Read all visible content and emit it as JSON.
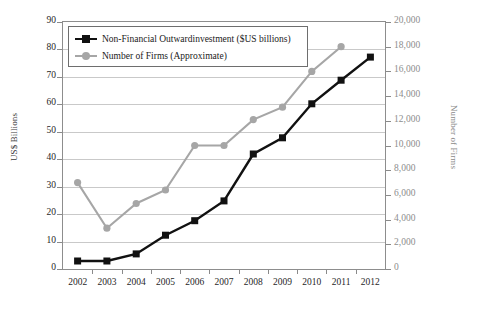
{
  "chart_data": {
    "type": "line",
    "title": "",
    "xlabel": "",
    "ylabel": "US$ Billions",
    "y2label": "Number of Firms",
    "grid": true,
    "legend_position": "top-left",
    "categories": [
      "2002",
      "2003",
      "2004",
      "2005",
      "2006",
      "2007",
      "2008",
      "2009",
      "2010",
      "2011",
      "2012"
    ],
    "x_tick_labels": [
      "2002",
      "2003",
      "2004",
      "2005",
      "2006",
      "2007",
      "2008",
      "2009",
      "2010",
      "2011",
      "2012"
    ],
    "ylim": [
      0,
      90
    ],
    "y_tick_labels": [
      "0",
      "10",
      "20",
      "30",
      "40",
      "50",
      "60",
      "70",
      "80",
      "90"
    ],
    "y_ticks": [
      0,
      10,
      20,
      30,
      40,
      50,
      60,
      70,
      80,
      90
    ],
    "y2lim": [
      0,
      20000
    ],
    "y2_tick_labels": [
      "0",
      "2,000",
      "4,000",
      "6,000",
      "8,000",
      "10,000",
      "12,000",
      "14,000",
      "16,000",
      "18,000",
      "20,000"
    ],
    "y2_ticks": [
      0,
      2000,
      4000,
      6000,
      8000,
      10000,
      12000,
      14000,
      16000,
      18000,
      20000
    ],
    "series": [
      {
        "name": "Non-Financial Outwardinvestment ($US billions)",
        "axis": "left",
        "color": "#111111",
        "marker": "square",
        "values": [
          2.9,
          2.9,
          5.5,
          12.3,
          17.6,
          24.8,
          41.9,
          47.8,
          60.2,
          68.8,
          77.2
        ]
      },
      {
        "name": "Number of Firms (Approximate)",
        "axis": "right",
        "color": "#a6a6a6",
        "marker": "circle",
        "values": [
          7000,
          3300,
          5300,
          6400,
          10000,
          10000,
          12100,
          13100,
          16000,
          18000,
          null
        ]
      }
    ]
  },
  "legend": {
    "items": [
      {
        "label": "Non-Financial Outwardinvestment ($US billions)",
        "color": "#111111",
        "marker": "square"
      },
      {
        "label": "Number of Firms (Approximate)",
        "color": "#a6a6a6",
        "marker": "circle"
      }
    ]
  },
  "axes": {
    "left_title": "US$ Billions",
    "right_title": "Number of Firms"
  }
}
